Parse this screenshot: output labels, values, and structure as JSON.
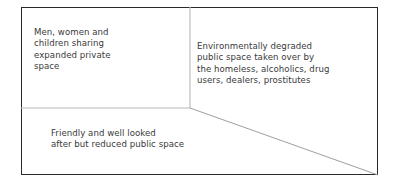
{
  "diagram": {
    "type": "partitioned-rectangle",
    "frame": {
      "border_color": "#2b2b2b",
      "fill_color": "#ffffff"
    },
    "partition_line_color": "#b7b7b7",
    "text_color": "#3a3a3a",
    "regions": [
      {
        "id": "expanded-private-space",
        "position": "top-left",
        "label": "Men, women and\nchildren sharing\nexpanded private\nspace"
      },
      {
        "id": "degraded-public-space",
        "position": "right",
        "label": "Environmentally degraded\npublic space taken over by\nthe homeless, alcoholics, drug\nusers, dealers, prostitutes"
      },
      {
        "id": "reduced-public-space",
        "position": "bottom-left",
        "label": "Friendly and well looked\nafter but reduced public space"
      }
    ],
    "partitions": [
      {
        "id": "vertical-divider",
        "x1": 190,
        "y1": 7,
        "x2": 190,
        "y2": 108
      },
      {
        "id": "horizontal-divider",
        "x1": 21,
        "y1": 108,
        "x2": 190,
        "y2": 108
      },
      {
        "id": "diagonal-divider",
        "x1": 190,
        "y1": 108,
        "x2": 378,
        "y2": 175
      }
    ]
  }
}
